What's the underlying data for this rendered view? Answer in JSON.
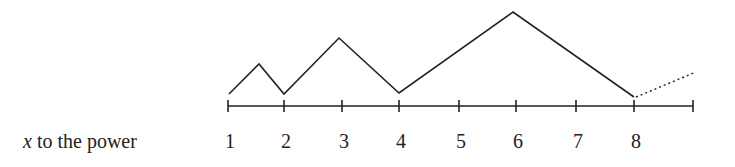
{
  "diagram": {
    "row_label_var": "x",
    "row_label_rest": " to the power",
    "tick_labels": [
      "1",
      "2",
      "3",
      "4",
      "5",
      "6",
      "7",
      "8"
    ],
    "tick_positions": [
      228,
      284,
      342,
      399,
      459,
      516,
      576,
      634,
      693
    ],
    "axis": {
      "x1": 228,
      "x2": 693,
      "y": 106,
      "tick_half": 6
    },
    "arcs_path": [
      [
        229,
        94
      ],
      [
        259,
        64
      ],
      [
        284,
        94
      ],
      [
        339,
        38
      ],
      [
        399,
        93
      ],
      [
        513,
        12
      ],
      [
        634,
        97
      ]
    ],
    "dotted_path": [
      [
        636,
        97
      ],
      [
        696,
        72
      ]
    ],
    "colors": {
      "stroke": "#222222",
      "background": "#ffffff"
    }
  }
}
